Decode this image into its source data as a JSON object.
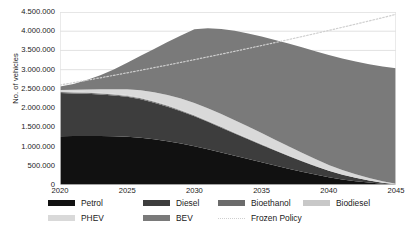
{
  "chart_data": {
    "type": "area",
    "stacked": true,
    "title": "",
    "xlabel": "",
    "ylabel": "No. of vehicles",
    "x": [
      2020,
      2021,
      2022,
      2023,
      2024,
      2025,
      2026,
      2027,
      2028,
      2029,
      2030,
      2031,
      2032,
      2033,
      2034,
      2035,
      2036,
      2037,
      2038,
      2039,
      2040,
      2041,
      2042,
      2043,
      2044,
      2045
    ],
    "xlim": [
      2020,
      2045
    ],
    "ylim": [
      0,
      4500000
    ],
    "xticks": [
      "2020",
      "2025",
      "2030",
      "2035",
      "2040",
      "2045"
    ],
    "xtick_values": [
      2020,
      2025,
      2030,
      2035,
      2040,
      2045
    ],
    "yticks": [
      "0",
      "500.000",
      "1.000.000",
      "1.500.000",
      "2.000.000",
      "2.500.000",
      "3.000.000",
      "3.500.000",
      "4.000.000",
      "4.500.000"
    ],
    "ytick_values": [
      0,
      500000,
      1000000,
      1500000,
      2000000,
      2500000,
      3000000,
      3500000,
      4000000,
      4500000
    ],
    "grid": true,
    "grid_axis": "y",
    "legend_position": "bottom",
    "series": [
      {
        "name": "Petrol",
        "color": "#111111",
        "values": [
          1270000,
          1272000,
          1274000,
          1272000,
          1266000,
          1255000,
          1230000,
          1190000,
          1140000,
          1080000,
          1010000,
          930000,
          845000,
          760000,
          675000,
          590000,
          505000,
          425000,
          345000,
          270000,
          200000,
          145000,
          100000,
          62000,
          30000,
          8000
        ]
      },
      {
        "name": "Diesel",
        "color": "#3d3d3d",
        "values": [
          1120000,
          1110000,
          1098000,
          1082000,
          1062000,
          1038000,
          1000000,
          952000,
          898000,
          840000,
          778000,
          712000,
          646000,
          580000,
          516000,
          452000,
          390000,
          330000,
          272000,
          218000,
          168000,
          124000,
          86000,
          54000,
          28000,
          9000
        ]
      },
      {
        "name": "Bioethanol",
        "color": "#6b6b6b",
        "values": [
          26000,
          26000,
          26000,
          26000,
          25000,
          25000,
          24000,
          23000,
          22000,
          21000,
          19000,
          18000,
          16000,
          15000,
          13000,
          12000,
          10000,
          9000,
          7000,
          6000,
          5000,
          4000,
          3000,
          2000,
          1000,
          400
        ]
      },
      {
        "name": "Biodiesel",
        "color": "#c8c8c8",
        "values": [
          22000,
          22000,
          22000,
          22000,
          21000,
          21000,
          20000,
          19000,
          18000,
          17000,
          16000,
          15000,
          13000,
          12000,
          11000,
          10000,
          9000,
          7000,
          6000,
          5000,
          4000,
          3000,
          2000,
          1500,
          800,
          300
        ]
      },
      {
        "name": "PHEV",
        "color": "#d9d9d9",
        "values": [
          32000,
          46000,
          64000,
          88000,
          118000,
          152000,
          190000,
          228000,
          262000,
          290000,
          312000,
          322000,
          324000,
          318000,
          306000,
          288000,
          265000,
          238000,
          208000,
          176000,
          144000,
          114000,
          86000,
          60000,
          36000,
          15000
        ]
      },
      {
        "name": "BEV",
        "color": "#7a7a7a",
        "values": [
          90000,
          154000,
          246000,
          366000,
          514000,
          689000,
          896000,
          1128000,
          1380000,
          1642000,
          1915000,
          2083000,
          2216000,
          2325000,
          2419000,
          2508000,
          2591000,
          2671000,
          2742000,
          2805000,
          2859000,
          2900000,
          2933000,
          2960000,
          2984000,
          3007000
        ]
      }
    ],
    "lines": [
      {
        "name": "Frozen Policy",
        "color": "#cfcfcf",
        "style": "dotted",
        "values": [
          2600000,
          2662000,
          2724000,
          2788000,
          2852000,
          2918000,
          2984000,
          3052000,
          3120000,
          3190000,
          3260000,
          3332000,
          3404000,
          3478000,
          3552000,
          3628000,
          3704000,
          3782000,
          3860000,
          3940000,
          4020000,
          4102000,
          4184000,
          4268000,
          4352000,
          4440000
        ]
      }
    ]
  },
  "legend": {
    "row1": [
      {
        "label": "Petrol",
        "color": "#111111",
        "style": "solid"
      },
      {
        "label": "Diesel",
        "color": "#3d3d3d",
        "style": "solid"
      },
      {
        "label": "Bioethanol",
        "color": "#6b6b6b",
        "style": "solid"
      },
      {
        "label": "Biodiesel",
        "color": "#c8c8c8",
        "style": "solid"
      }
    ],
    "row2": [
      {
        "label": "PHEV",
        "color": "#d9d9d9",
        "style": "solid"
      },
      {
        "label": "BEV",
        "color": "#7a7a7a",
        "style": "solid"
      },
      {
        "label": "Frozen Policy",
        "color": "#cfcfcf",
        "style": "dotted"
      }
    ]
  }
}
